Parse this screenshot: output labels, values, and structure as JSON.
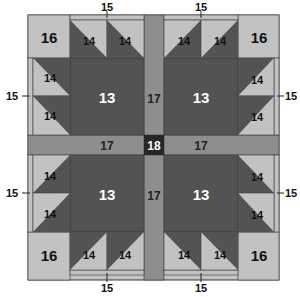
{
  "diagram": {
    "type": "quilt-block-layout",
    "colors": {
      "light": "#c2c2c2",
      "dark": "#535353",
      "sashing": "#8e8e8e",
      "center": "#262626",
      "outline": "#3a3a3a",
      "label_dark": "#111111",
      "label_light": "#ffffff"
    },
    "labels": {
      "center_square": "13",
      "triangle": "14",
      "strip": "15",
      "corner": "16",
      "sashing": "17",
      "center": "18"
    },
    "callouts": {
      "top": "15",
      "bottom": "15",
      "left": "15",
      "right": "15"
    },
    "blocks": [
      {
        "position": "top-left",
        "center_label": "13",
        "corner_label": "16",
        "triangle_labels": [
          "14",
          "14",
          "14",
          "14"
        ]
      },
      {
        "position": "top-right",
        "center_label": "13",
        "corner_label": "16",
        "triangle_labels": [
          "14",
          "14",
          "14",
          "14"
        ]
      },
      {
        "position": "bottom-left",
        "center_label": "13",
        "corner_label": "16",
        "triangle_labels": [
          "14",
          "14",
          "14",
          "14"
        ]
      },
      {
        "position": "bottom-right",
        "center_label": "13",
        "corner_label": "16",
        "triangle_labels": [
          "14",
          "14",
          "14",
          "14"
        ]
      }
    ],
    "sashing_labels": {
      "top": "17",
      "bottom": "17",
      "left": "17",
      "right": "17",
      "center": "18"
    }
  }
}
